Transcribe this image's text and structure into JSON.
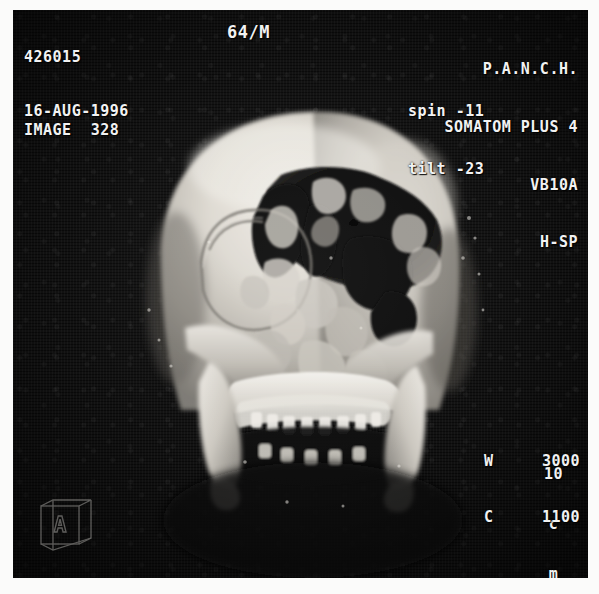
{
  "study": {
    "age_sex": "64/M",
    "patient_id": "426015",
    "date": "16-AUG-1996",
    "image_label": "IMAGE  328"
  },
  "site": {
    "institution": "P.A.N.C.H.",
    "scanner": "SOMATOM PLUS 4",
    "software_version": "VB10A",
    "patient_position": "H-SP"
  },
  "geometry": {
    "spin": "spin -11",
    "tilt": "tilt -23"
  },
  "scale": {
    "value": "10",
    "unit_line1": "c",
    "unit_line2": "m"
  },
  "window": {
    "width_label": "W",
    "width_value": "3000",
    "center_label": "C",
    "center_value": "1100"
  },
  "orientation": {
    "face_letter": "A"
  },
  "colors": {
    "background": "#fbfbfa",
    "image_background": "#0b0b0b",
    "overlay_text": "#f2f2f2",
    "bone_bright": "#e8e6e1",
    "bone_mid": "#b3b0a9",
    "bone_dark": "#6d6a64",
    "cavity": "#0d0d0d"
  }
}
